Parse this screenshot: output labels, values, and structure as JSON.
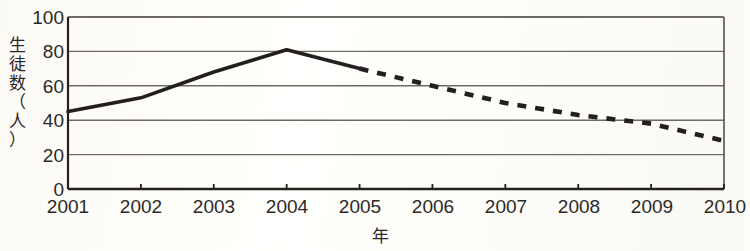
{
  "chart_data": {
    "type": "line",
    "title": "",
    "xlabel": "年",
    "ylabel": "生徒数（人）",
    "ylabel_chars": "生\n徒\n数\n（\n人\n）",
    "xlim": [
      2001,
      2010
    ],
    "ylim": [
      0,
      100
    ],
    "grid": true,
    "legend": "none",
    "x": [
      2001,
      2002,
      2003,
      2004,
      2005,
      2006,
      2007,
      2008,
      2009,
      2010
    ],
    "xticks": [
      "2001",
      "2002",
      "2003",
      "2004",
      "2005",
      "2006",
      "2007",
      "2008",
      "2009",
      "2010"
    ],
    "yticks": [
      "0",
      "20",
      "40",
      "60",
      "80",
      "100"
    ],
    "ytick_values": [
      0,
      20,
      40,
      60,
      80,
      100
    ],
    "series": [
      {
        "name": "actual",
        "style": "solid",
        "color": "#231f1f",
        "x": [
          2001,
          2002,
          2003,
          2004,
          2005
        ],
        "values": [
          45,
          53,
          68,
          81,
          70
        ]
      },
      {
        "name": "projected",
        "style": "dashed",
        "color": "#231f1f",
        "x": [
          2005,
          2006,
          2007,
          2008,
          2009,
          2010
        ],
        "values": [
          70,
          60,
          50,
          43,
          38,
          28
        ]
      }
    ],
    "colors": {
      "line": "#231f1f",
      "grid": "#6e6a66",
      "axis": "#23201d",
      "text": "#2d2926",
      "background": "#fcfbf8"
    }
  },
  "axes": {
    "y_title": "生徒数（人）",
    "x_title": "年"
  }
}
